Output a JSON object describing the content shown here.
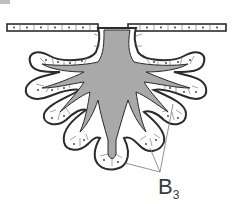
{
  "diagram": {
    "type": "compound branched gland cross-section",
    "label": {
      "main": "B",
      "subscript": "3"
    },
    "colors": {
      "lumen": "#a9a9a9",
      "outline": "#2b2b2b",
      "cell_fill": "#ffffff",
      "cell_line": "#555555",
      "leader": "#777777"
    }
  }
}
